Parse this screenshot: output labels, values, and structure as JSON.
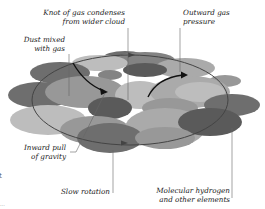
{
  "diagram": {
    "colors": {
      "background": "#ffffff",
      "leader_line": "#666666",
      "arrow": "#111111",
      "rotation_ring": "#444444",
      "cloud_shades": [
        "#5a5a5a",
        "#6e6e6e",
        "#838383",
        "#989898",
        "#aaaaaa",
        "#bdbdbd",
        "#cccccc"
      ]
    },
    "labels": {
      "knot": {
        "line1": "Knot of gas condenses",
        "line2": "from wider cloud"
      },
      "outward": {
        "line1": "Outward gas",
        "line2": "pressure"
      },
      "dust": {
        "line1": "Dust mixed",
        "line2": "with gas"
      },
      "inward": {
        "line1": "Inward pull",
        "line2": "of gravity"
      },
      "rotation": {
        "line1": "Slow rotation"
      },
      "hydrogen": {
        "line1": "Molecular hydrogen",
        "line2": "and other elements"
      },
      "edge_fragment_1": "t",
      "edge_fragment_2": "..."
    }
  }
}
